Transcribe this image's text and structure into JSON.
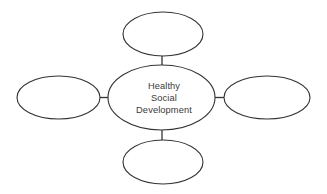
{
  "diagram": {
    "type": "concept-map",
    "title": "Healthy Social Development",
    "background_color": "#ffffff",
    "stroke_color": "#333333",
    "text_color": "#3a3a3a",
    "center_node": {
      "id": "center",
      "label_lines": [
        "Healthy",
        "Social",
        "Development"
      ],
      "line1": "Healthy",
      "line2": "Social",
      "line3": "Development",
      "cx": 161.5,
      "cy": 97.5,
      "rx": 53.5,
      "ry": 32.5
    },
    "satellite_nodes": [
      {
        "id": "top",
        "position": "top",
        "label": "",
        "cx": 163,
        "cy": 34,
        "rx": 40,
        "ry": 22
      },
      {
        "id": "left",
        "position": "left",
        "label": "",
        "cx": 58.5,
        "cy": 97.5,
        "rx": 41.5,
        "ry": 21.5
      },
      {
        "id": "right",
        "position": "right",
        "label": "",
        "cx": 267,
        "cy": 97.5,
        "rx": 43,
        "ry": 21.5
      },
      {
        "id": "bottom",
        "position": "bottom",
        "label": "",
        "cx": 163,
        "cy": 162,
        "rx": 40,
        "ry": 22
      }
    ],
    "connectors": [
      {
        "id": "center-to-top",
        "from": "center",
        "to": "top",
        "x1": 162,
        "y1": 65,
        "x2": 162,
        "y2": 56
      },
      {
        "id": "center-to-left",
        "from": "center",
        "to": "left",
        "x1": 100,
        "y1": 97.5,
        "x2": 108.5,
        "y2": 97.5
      },
      {
        "id": "center-to-right",
        "from": "center",
        "to": "right",
        "x1": 215,
        "y1": 97.5,
        "x2": 224,
        "y2": 97.5
      },
      {
        "id": "center-to-bottom",
        "from": "center",
        "to": "bottom",
        "x1": 162,
        "y1": 130,
        "x2": 162,
        "y2": 140
      }
    ]
  }
}
